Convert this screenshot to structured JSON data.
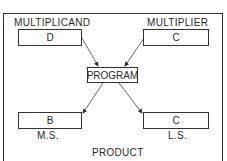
{
  "diagram": {
    "top_left": {
      "label": "MULTIPLICAND",
      "value": "D"
    },
    "top_right": {
      "label": "MULTIPLIER",
      "value": "C"
    },
    "center": {
      "value": "PROGRAM"
    },
    "bottom_left": {
      "value": "B",
      "label": "M.S."
    },
    "bottom_right": {
      "value": "C",
      "label": "L.S."
    },
    "footer": "PRODUCT"
  }
}
